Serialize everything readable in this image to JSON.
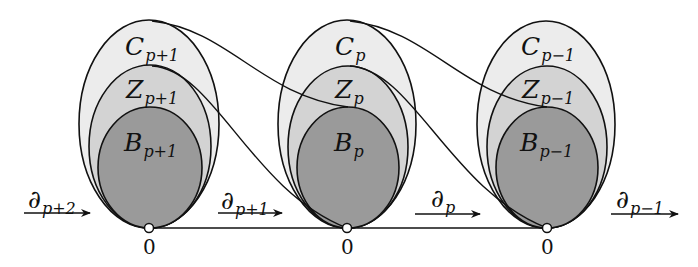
{
  "diagram": {
    "type": "chain complex diagram",
    "colors": {
      "C_fill": "#ececec",
      "Z_fill": "#d3d3d3",
      "B_fill": "#9a9a9a",
      "stroke": "#111111"
    },
    "groups": [
      {
        "C": {
          "base": "C",
          "sub": "p+1"
        },
        "Z": {
          "base": "Z",
          "sub": "p+1"
        },
        "B": {
          "base": "B",
          "sub": "p+1"
        },
        "zero": "0"
      },
      {
        "C": {
          "base": "C",
          "sub": "p"
        },
        "Z": {
          "base": "Z",
          "sub": "p"
        },
        "B": {
          "base": "B",
          "sub": "p"
        },
        "zero": "0"
      },
      {
        "C": {
          "base": "C",
          "sub": "p−1"
        },
        "Z": {
          "base": "Z",
          "sub": "p−1"
        },
        "B": {
          "base": "B",
          "sub": "p−1"
        },
        "zero": "0"
      }
    ],
    "maps": [
      {
        "base": "∂",
        "sub": "p+2"
      },
      {
        "base": "∂",
        "sub": "p+1"
      },
      {
        "base": "∂",
        "sub": "p"
      },
      {
        "base": "∂",
        "sub": "p−1"
      }
    ]
  }
}
